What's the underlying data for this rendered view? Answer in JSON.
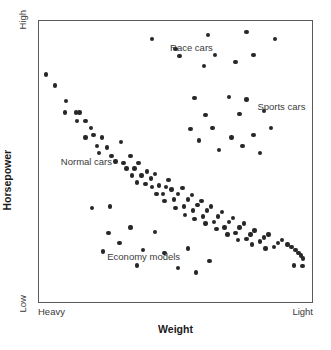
{
  "chart_data": {
    "type": "scatter",
    "title": "",
    "xlabel": "Weight",
    "ylabel": "Horsepower",
    "xlim": [
      0,
      100
    ],
    "ylim": [
      0,
      100
    ],
    "grid": false,
    "legend_position": "none",
    "x_tick_labels": [
      "Heavy",
      "Light"
    ],
    "y_tick_labels": [
      "Low",
      "High"
    ],
    "x_axis_note": "Heavy at left, Light at right (weight decreases left to right)",
    "y_axis_note": "Low at bottom, High at top",
    "annotations": [
      {
        "text": "Race cars",
        "x": 48.0,
        "y": 90.5
      },
      {
        "text": "Sports cars",
        "x": 80.0,
        "y": 69.5
      },
      {
        "text": "Normal cars",
        "x": 8.0,
        "y": 50.0
      },
      {
        "text": "Economy models",
        "x": 25.0,
        "y": 16.0
      }
    ],
    "series": [
      {
        "name": "Normal cars",
        "comment": "Dense negatively-sloped diagonal band running from upper-left (heavy, higher hp) to lower-right (light, lower hp)",
        "points": [
          [
            2.5,
            81.0
          ],
          [
            5.8,
            77.0
          ],
          [
            9.9,
            71.5
          ],
          [
            9.6,
            67.5
          ],
          [
            13.5,
            67.5
          ],
          [
            14.9,
            67.5
          ],
          [
            13.9,
            64.5
          ],
          [
            17.1,
            64.5
          ],
          [
            19.0,
            62.0
          ],
          [
            19.9,
            59.5
          ],
          [
            17.1,
            58.5
          ],
          [
            23.0,
            58.5
          ],
          [
            21.2,
            55.5
          ],
          [
            25.0,
            55.0
          ],
          [
            22.0,
            53.0
          ],
          [
            26.5,
            52.0
          ],
          [
            30.1,
            57.0
          ],
          [
            28.0,
            50.0
          ],
          [
            31.0,
            49.5
          ],
          [
            33.5,
            52.0
          ],
          [
            32.0,
            47.5
          ],
          [
            35.0,
            47.5
          ],
          [
            36.5,
            49.5
          ],
          [
            34.0,
            45.0
          ],
          [
            37.5,
            45.0
          ],
          [
            39.5,
            46.5
          ],
          [
            36.0,
            42.5
          ],
          [
            39.0,
            42.0
          ],
          [
            41.0,
            44.0
          ],
          [
            42.5,
            45.5
          ],
          [
            41.5,
            41.0
          ],
          [
            44.0,
            41.5
          ],
          [
            43.0,
            38.5
          ],
          [
            45.5,
            38.5
          ],
          [
            46.5,
            41.0
          ],
          [
            47.5,
            43.5
          ],
          [
            48.5,
            40.0
          ],
          [
            46.0,
            36.0
          ],
          [
            49.5,
            36.5
          ],
          [
            51.0,
            38.5
          ],
          [
            52.5,
            40.5
          ],
          [
            50.0,
            33.5
          ],
          [
            53.0,
            34.0
          ],
          [
            54.5,
            36.5
          ],
          [
            56.0,
            38.0
          ],
          [
            53.5,
            31.0
          ],
          [
            56.5,
            32.5
          ],
          [
            58.0,
            34.5
          ],
          [
            59.5,
            36.0
          ],
          [
            57.0,
            29.5
          ],
          [
            60.0,
            30.5
          ],
          [
            61.5,
            32.5
          ],
          [
            63.0,
            34.0
          ],
          [
            61.0,
            28.0
          ],
          [
            64.0,
            28.5
          ],
          [
            65.5,
            30.5
          ],
          [
            67.0,
            32.0
          ],
          [
            65.0,
            26.0
          ],
          [
            68.0,
            26.5
          ],
          [
            69.5,
            28.5
          ],
          [
            71.0,
            30.0
          ],
          [
            69.0,
            24.0
          ],
          [
            72.0,
            24.5
          ],
          [
            73.5,
            26.5
          ],
          [
            75.0,
            28.0
          ],
          [
            73.0,
            22.0
          ],
          [
            76.0,
            22.5
          ],
          [
            77.5,
            24.0
          ],
          [
            79.0,
            25.5
          ],
          [
            78.0,
            20.5
          ],
          [
            81.0,
            21.5
          ],
          [
            82.5,
            23.0
          ],
          [
            84.0,
            24.0
          ],
          [
            83.0,
            19.0
          ],
          [
            86.0,
            19.5
          ],
          [
            87.5,
            21.0
          ],
          [
            89.0,
            22.0
          ],
          [
            91.0,
            20.5
          ],
          [
            92.5,
            19.5
          ],
          [
            94.0,
            18.5
          ],
          [
            95.0,
            17.5
          ],
          [
            96.0,
            16.5
          ],
          [
            96.8,
            15.5
          ],
          [
            93.5,
            13.0
          ],
          [
            96.5,
            12.8
          ]
        ]
      },
      {
        "name": "Race cars",
        "comment": "High-horsepower cluster at top of plot, spread across the light half",
        "points": [
          [
            41.5,
            93.5
          ],
          [
            50.0,
            90.0
          ],
          [
            62.0,
            95.0
          ],
          [
            76.0,
            96.0
          ],
          [
            86.5,
            93.5
          ],
          [
            51.5,
            87.5
          ],
          [
            64.5,
            88.0
          ],
          [
            78.5,
            88.0
          ],
          [
            60.5,
            84.0
          ],
          [
            72.0,
            85.5
          ]
        ]
      },
      {
        "name": "Sports cars",
        "comment": "Mid-to-high horsepower cluster on the light (right) side of the plot",
        "points": [
          [
            57.0,
            72.5
          ],
          [
            69.5,
            73.0
          ],
          [
            76.0,
            72.0
          ],
          [
            61.0,
            66.5
          ],
          [
            73.5,
            67.0
          ],
          [
            82.5,
            68.0
          ],
          [
            55.5,
            61.5
          ],
          [
            63.5,
            62.0
          ],
          [
            70.5,
            58.5
          ],
          [
            78.5,
            59.5
          ],
          [
            85.0,
            62.0
          ],
          [
            58.5,
            57.5
          ],
          [
            66.0,
            54.0
          ],
          [
            74.5,
            55.5
          ],
          [
            81.0,
            53.0
          ]
        ]
      },
      {
        "name": "Economy models",
        "comment": "Low-horsepower scatter below the main band, mid-weight range",
        "points": [
          [
            19.5,
            33.5
          ],
          [
            26.0,
            34.0
          ],
          [
            25.5,
            24.5
          ],
          [
            33.5,
            26.5
          ],
          [
            29.5,
            21.0
          ],
          [
            42.5,
            25.0
          ],
          [
            23.5,
            18.0
          ],
          [
            38.0,
            18.5
          ],
          [
            46.0,
            17.5
          ],
          [
            36.0,
            13.0
          ],
          [
            54.5,
            19.0
          ],
          [
            51.0,
            12.0
          ],
          [
            57.5,
            10.5
          ],
          [
            62.5,
            14.5
          ]
        ]
      }
    ]
  },
  "axis": {
    "y_high_label": "High",
    "y_low_label": "Low",
    "x_heavy_label": "Heavy",
    "x_light_label": "Light",
    "y_title": "Horsepower",
    "x_title": "Weight"
  },
  "style": {
    "point_color": "#272727",
    "frame_color": "#5a5a5a",
    "label_color": "#3a3a3a",
    "title_color": "#1a1a1a",
    "background": "#ffffff"
  }
}
